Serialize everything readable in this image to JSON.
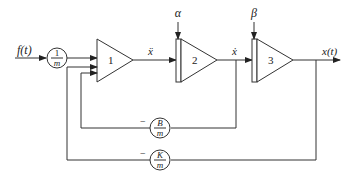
{
  "diagram": {
    "type": "analog-computer block diagram",
    "input": {
      "label": "f(t)"
    },
    "gains": {
      "input_gain": {
        "num": "1",
        "den": "m"
      },
      "damping_feedback": {
        "sign": "−",
        "num": "B",
        "den": "m"
      },
      "spring_feedback": {
        "sign": "−",
        "num": "K",
        "den": "m"
      }
    },
    "blocks": [
      {
        "id": "1",
        "label": "1",
        "kind": "summing amplifier"
      },
      {
        "id": "2",
        "label": "2",
        "kind": "integrator",
        "ic_label": "α"
      },
      {
        "id": "3",
        "label": "3",
        "kind": "integrator",
        "ic_label": "β"
      }
    ],
    "signals": {
      "after_1": "ẍ",
      "after_2": "ẋ",
      "output": "x(t)"
    }
  }
}
